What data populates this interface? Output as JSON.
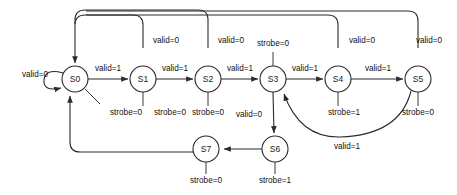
{
  "diagram": {
    "kind": "finite-state-machine",
    "title": "",
    "states": [
      {
        "id": "S0",
        "label": "S0",
        "cx": 75,
        "cy": 79,
        "r": 13
      },
      {
        "id": "S1",
        "label": "S1",
        "cx": 143,
        "cy": 79,
        "r": 13
      },
      {
        "id": "S2",
        "label": "S2",
        "cx": 208,
        "cy": 79,
        "r": 13
      },
      {
        "id": "S3",
        "label": "S3",
        "cx": 273,
        "cy": 79,
        "r": 13
      },
      {
        "id": "S4",
        "label": "S4",
        "cx": 338,
        "cy": 79,
        "r": 13
      },
      {
        "id": "S5",
        "label": "S5",
        "cx": 418,
        "cy": 79,
        "r": 13
      },
      {
        "id": "S6",
        "label": "S6",
        "cx": 275,
        "cy": 149,
        "r": 13
      },
      {
        "id": "S7",
        "label": "S7",
        "cx": 206,
        "cy": 149,
        "r": 13
      }
    ],
    "transitions": [
      {
        "from": "S0",
        "to": "S0",
        "label": "valid=0"
      },
      {
        "from": "S0",
        "to": "S1",
        "label": "valid=1"
      },
      {
        "from": "S1",
        "to": "S2",
        "label": "valid=1"
      },
      {
        "from": "S2",
        "to": "S3",
        "label": "valid=1"
      },
      {
        "from": "S3",
        "to": "S4",
        "label": "valid=1"
      },
      {
        "from": "S4",
        "to": "S5",
        "label": "valid=1"
      },
      {
        "from": "S1",
        "to": "S0",
        "label": "valid=0"
      },
      {
        "from": "S2",
        "to": "S0",
        "label": "valid=0"
      },
      {
        "from": "S4",
        "to": "S0",
        "label": "valid=0"
      },
      {
        "from": "S5",
        "to": "S0",
        "label": "valid=0"
      },
      {
        "from": "S3",
        "to": "S6",
        "label": "valid=0"
      },
      {
        "from": "S5",
        "to": "S3",
        "label": "valid=1"
      },
      {
        "from": "S6",
        "to": "S7",
        "label": ""
      },
      {
        "from": "S7",
        "to": "S0",
        "label": ""
      }
    ],
    "outputs": [
      {
        "state": "S0",
        "label": "strobe=0"
      },
      {
        "state": "S1",
        "label": "strobe=0"
      },
      {
        "state": "S2",
        "label": "strobe=0"
      },
      {
        "state": "S3",
        "label": "strobe=0"
      },
      {
        "state": "S4",
        "label": "strobe=1"
      },
      {
        "state": "S5",
        "label": "strobe=0"
      },
      {
        "state": "S6",
        "label": "strobe=1"
      },
      {
        "state": "S7",
        "label": "strobe=0"
      }
    ],
    "labels": {
      "self_loop_s0": "valid=0",
      "s0_s1": "valid=1",
      "s1_s2": "valid=1",
      "s2_s3": "valid=1",
      "s3_s4": "valid=1",
      "s4_s5": "valid=1",
      "s1_back": "valid=0",
      "s2_back": "valid=0",
      "s4_back": "valid=0",
      "s5_back": "valid=0",
      "s3_s6": "valid=0",
      "s5_s3": "valid=1",
      "out_s0": "strobe=0",
      "out_s1": "strobe=0",
      "out_s2": "strobe=0",
      "out_s3": "strobe=0",
      "out_s4": "strobe=1",
      "out_s5": "strobe=0",
      "out_s6": "strobe=1",
      "out_s7": "strobe=0"
    },
    "colors": {
      "stroke": "#2b2b2b",
      "text": "#111111",
      "background": "#ffffff"
    }
  }
}
